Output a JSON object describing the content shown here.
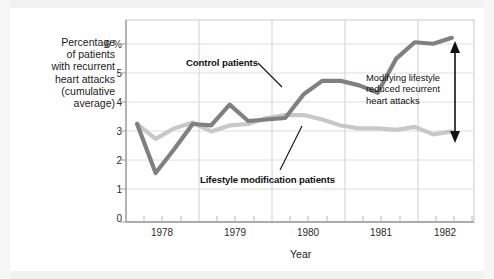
{
  "chart_data": {
    "type": "line",
    "title": "",
    "xlabel": "Year",
    "ylabel": "Percentage\nof patients\nwith recurrent\nheart attacks\n(cumulative\naverage)",
    "ylabel_lines": [
      "Percentage",
      "of patients",
      "with recurrent",
      "heart attacks",
      "(cumulative",
      "average)"
    ],
    "ytick_labels": [
      "0",
      "1",
      "2",
      "3",
      "4",
      "5",
      "6 %"
    ],
    "ytick_values": [
      0,
      1,
      2,
      3,
      4,
      5,
      6
    ],
    "ylim": [
      0,
      6.8
    ],
    "xtick_labels": [
      "1978",
      "1979",
      "1980",
      "1981",
      "1982"
    ],
    "xtick_values": [
      1978,
      1979,
      1980,
      1981,
      1982
    ],
    "xlim": [
      1977.6,
      1982.3
    ],
    "grid": "both",
    "minor_xticks_per_year": 4,
    "legend": "inline-callouts",
    "x": [
      1977.75,
      1978.0,
      1978.25,
      1978.5,
      1978.75,
      1979.0,
      1979.25,
      1979.5,
      1979.75,
      1980.0,
      1980.25,
      1980.5,
      1980.75,
      1981.0,
      1981.25,
      1981.5,
      1981.75,
      1982.0
    ],
    "series": [
      {
        "name": "Control patients",
        "color": "#808080",
        "values": [
          3.3,
          1.65,
          2.45,
          3.3,
          3.25,
          3.95,
          3.4,
          3.45,
          3.5,
          4.3,
          4.75,
          4.75,
          4.6,
          4.35,
          5.5,
          6.05,
          6.0,
          6.2
        ]
      },
      {
        "name": "Lifestyle modification patients",
        "color": "#c8c8c8",
        "values": [
          3.3,
          2.8,
          3.15,
          3.35,
          3.05,
          3.25,
          3.3,
          3.5,
          3.6,
          3.6,
          3.45,
          3.25,
          3.15,
          3.15,
          3.1,
          3.2,
          2.95,
          3.05
        ]
      }
    ],
    "annotations": [
      {
        "name": "control-patients-callout",
        "text": "Control patients",
        "target_series": "Control patients"
      },
      {
        "name": "lifestyle-patients-callout",
        "text": "Lifestyle modification patients",
        "target_series": "Lifestyle modification patients"
      },
      {
        "name": "difference-arrow-note",
        "text": "Modifying lifestyle\nreduced recurrent\nheart attacks",
        "lines": [
          "Modifying lifestyle",
          "reduced recurrent",
          "heart attacks"
        ],
        "arrow": {
          "x": 1982.0,
          "y_top": 6.2,
          "y_bottom": 3.05,
          "double_headed": true
        }
      }
    ],
    "colors": {
      "control_line": "#808080",
      "lifestyle_line": "#c8c8c8",
      "grid": "#dcdcdc",
      "axis": "#9a9a9a",
      "text": "#1a1a1a",
      "background": "#ffffff"
    }
  }
}
